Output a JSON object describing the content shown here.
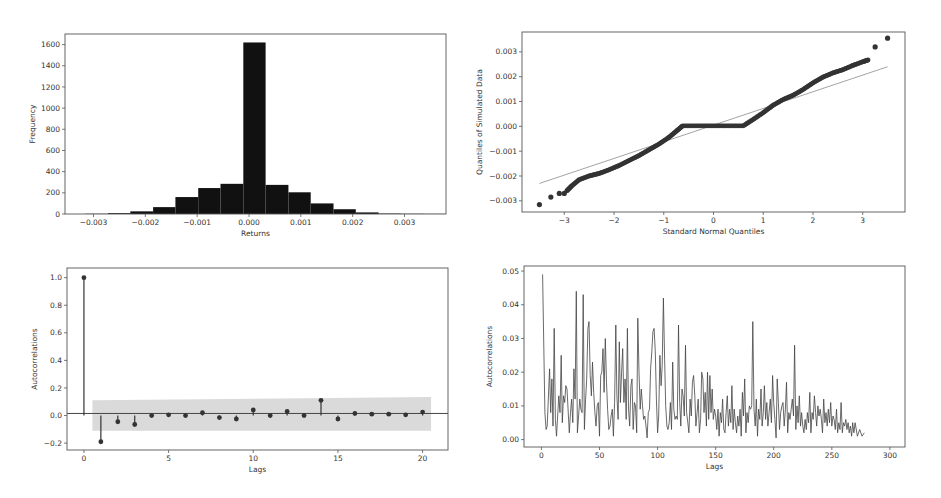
{
  "chart_data": [
    {
      "id": "histogram",
      "type": "bar",
      "title": "",
      "xlabel": "Returns",
      "ylabel": "Frequency",
      "xlim": [
        -0.00355,
        0.0038
      ],
      "ylim": [
        0,
        1700
      ],
      "xticks": [
        -0.003,
        -0.002,
        -0.001,
        0.0,
        0.001,
        0.002,
        0.003
      ],
      "xtick_labels": [
        "−0.003",
        "−0.002",
        "−0.001",
        "0.000",
        "0.001",
        "0.002",
        "0.003"
      ],
      "yticks": [
        0,
        200,
        400,
        600,
        800,
        1000,
        1200,
        1400,
        1600
      ],
      "bin_edges": [
        -0.00316,
        -0.00272,
        -0.00229,
        -0.00185,
        -0.00142,
        -0.00098,
        -0.00055,
        -0.00011,
        0.00032,
        0.00076,
        0.00119,
        0.00163,
        0.00206,
        0.0025,
        0.00293,
        0.00337,
        0.0038
      ],
      "values": [
        2,
        8,
        25,
        65,
        160,
        245,
        285,
        1620,
        275,
        205,
        100,
        45,
        15,
        4,
        2,
        1
      ],
      "color": "#111111",
      "grid": false
    },
    {
      "id": "qq-plot",
      "type": "scatter",
      "title": "",
      "xlabel": "Standard Normal Quantiles",
      "ylabel": "Quantiles of Simulated Data",
      "xlim": [
        -3.85,
        3.85
      ],
      "ylim": [
        -0.00345,
        0.0038
      ],
      "xticks": [
        -3,
        -2,
        -1,
        0,
        1,
        2,
        3
      ],
      "xtick_labels": [
        "−3",
        "−2",
        "−1",
        "0",
        "1",
        "2",
        "3"
      ],
      "yticks": [
        -0.003,
        -0.002,
        -0.001,
        0.0,
        0.001,
        0.002,
        0.003
      ],
      "ytick_labels": [
        "−0.003",
        "−0.002",
        "−0.001",
        "0.000",
        "0.001",
        "0.002",
        "0.003"
      ],
      "series": [
        {
          "name": "sample quantiles",
          "points": [
            [
              -3.5,
              -0.00315
            ],
            [
              -3.27,
              -0.00285
            ],
            [
              -3.1,
              -0.0027
            ],
            [
              -3.0,
              -0.0027
            ],
            [
              -2.95,
              -0.0026
            ],
            [
              -2.85,
              -0.0024
            ],
            [
              -2.7,
              -0.00215
            ],
            [
              -2.5,
              -0.002
            ],
            [
              -2.3,
              -0.0019
            ],
            [
              -2.1,
              -0.00175
            ],
            [
              -1.9,
              -0.00158
            ],
            [
              -1.7,
              -0.00138
            ],
            [
              -1.5,
              -0.00118
            ],
            [
              -1.3,
              -0.00095
            ],
            [
              -1.1,
              -0.00072
            ],
            [
              -0.9,
              -0.00045
            ],
            [
              -0.75,
              -0.0002
            ],
            [
              -0.62,
              2e-05
            ],
            [
              -0.3,
              2e-05
            ],
            [
              0.0,
              2e-05
            ],
            [
              0.3,
              2e-05
            ],
            [
              0.6,
              2e-05
            ],
            [
              0.8,
              0.00028
            ],
            [
              1.0,
              0.00055
            ],
            [
              1.2,
              0.00085
            ],
            [
              1.4,
              0.00108
            ],
            [
              1.6,
              0.00125
            ],
            [
              1.8,
              0.00148
            ],
            [
              2.0,
              0.00175
            ],
            [
              2.2,
              0.00198
            ],
            [
              2.4,
              0.00215
            ],
            [
              2.6,
              0.00228
            ],
            [
              2.8,
              0.00245
            ],
            [
              3.0,
              0.0026
            ],
            [
              3.12,
              0.00268
            ],
            [
              3.25,
              0.0032
            ],
            [
              3.5,
              0.00355
            ]
          ],
          "color": "#333333"
        },
        {
          "name": "reference line",
          "points": [
            [
              -3.5,
              -0.0023
            ],
            [
              3.5,
              0.0024
            ]
          ],
          "color": "#999999"
        }
      ],
      "grid": false
    },
    {
      "id": "acf-stem",
      "type": "bar",
      "subtype": "stem",
      "title": "",
      "xlabel": "Lags",
      "ylabel": "Autocorrelations",
      "xlim": [
        -1,
        21.5
      ],
      "ylim": [
        -0.25,
        1.07
      ],
      "xticks": [
        0,
        5,
        10,
        15,
        20
      ],
      "yticks": [
        -0.2,
        0.0,
        0.2,
        0.4,
        0.6,
        0.8,
        1.0
      ],
      "ytick_labels": [
        "−0.2",
        "0.0",
        "0.2",
        "0.4",
        "0.6",
        "0.8",
        "1.0"
      ],
      "categories": [
        0,
        1,
        2,
        3,
        4,
        5,
        6,
        7,
        8,
        9,
        10,
        11,
        12,
        13,
        14,
        15,
        16,
        17,
        18,
        19,
        20
      ],
      "values": [
        1.0,
        -0.19,
        -0.045,
        -0.065,
        0.0,
        0.005,
        0.0,
        0.02,
        -0.015,
        -0.025,
        0.04,
        0.0,
        0.03,
        0.0,
        0.11,
        -0.025,
        0.015,
        0.01,
        0.01,
        0.005,
        0.025
      ],
      "confidence_band": {
        "x_start": 0.5,
        "x_end": 20.5,
        "upper_start": 0.11,
        "upper_end": 0.135,
        "lower_start": -0.11,
        "lower_end": -0.11,
        "color": "#d6d6d6"
      },
      "color": "#333333",
      "grid": false
    },
    {
      "id": "acf-line",
      "type": "line",
      "title": "",
      "xlabel": "Lags",
      "ylabel": "Autocorrelations",
      "xlim": [
        -15,
        313
      ],
      "ylim": [
        -0.0022,
        0.0515
      ],
      "xticks": [
        0,
        50,
        100,
        150,
        200,
        250,
        300
      ],
      "yticks": [
        0.0,
        0.01,
        0.02,
        0.03,
        0.04,
        0.05
      ],
      "ytick_labels": [
        "0.00",
        "0.01",
        "0.02",
        "0.03",
        "0.04",
        "0.05"
      ],
      "x": [
        1,
        3,
        4,
        5,
        7,
        8,
        9,
        10,
        11,
        12,
        13,
        15,
        16,
        17,
        18,
        19,
        20,
        21,
        22,
        24,
        25,
        26,
        27,
        28,
        29,
        30,
        31,
        33,
        34,
        35,
        36,
        37,
        38,
        39,
        40,
        41,
        42,
        43,
        44,
        45,
        46,
        47,
        48,
        49,
        50,
        51,
        52,
        53,
        54,
        55,
        56,
        57,
        58,
        59,
        60,
        61,
        62,
        63,
        64,
        65,
        66,
        67,
        68,
        69,
        70,
        71,
        72,
        73,
        74,
        75,
        76,
        77,
        78,
        79,
        80,
        81,
        82,
        83,
        84,
        85,
        86,
        87,
        88,
        89,
        90,
        91,
        92,
        93,
        94,
        95,
        96,
        97,
        98,
        99,
        100,
        101,
        102,
        103,
        104,
        105,
        106,
        107,
        108,
        109,
        110,
        111,
        112,
        113,
        114,
        115,
        116,
        117,
        118,
        119,
        120,
        121,
        122,
        123,
        124,
        125,
        126,
        127,
        128,
        129,
        130,
        131,
        132,
        133,
        134,
        135,
        136,
        137,
        138,
        139,
        140,
        141,
        142,
        143,
        144,
        145,
        146,
        147,
        148,
        149,
        150,
        151,
        152,
        153,
        154,
        155,
        156,
        157,
        158,
        159,
        160,
        161,
        162,
        163,
        164,
        165,
        166,
        167,
        168,
        169,
        170,
        171,
        172,
        173,
        174,
        175,
        176,
        177,
        178,
        179,
        180,
        181,
        182,
        183,
        184,
        185,
        186,
        187,
        188,
        189,
        190,
        191,
        192,
        193,
        194,
        195,
        196,
        197,
        198,
        199,
        200,
        201,
        202,
        203,
        204,
        205,
        206,
        207,
        208,
        209,
        210,
        211,
        212,
        213,
        214,
        215,
        216,
        217,
        218,
        219,
        220,
        221,
        222,
        223,
        224,
        225,
        226,
        227,
        228,
        229,
        230,
        231,
        232,
        233,
        234,
        235,
        236,
        237,
        238,
        239,
        240,
        241,
        242,
        243,
        244,
        245,
        246,
        247,
        248,
        249,
        250,
        251,
        252,
        253,
        254,
        255,
        256,
        257,
        258,
        259,
        260,
        261,
        262,
        263,
        264,
        265,
        266,
        267,
        268,
        269,
        270,
        272,
        274,
        276,
        278,
        280,
        282,
        284,
        286,
        288,
        290,
        292,
        294,
        296,
        297
      ],
      "values": [
        0.049,
        0.008,
        0.003,
        0.004,
        0.021,
        0.008,
        0.018,
        0.004,
        0.033,
        0.006,
        0.001,
        0.013,
        0.008,
        0.025,
        0.005,
        0.013,
        0.011,
        0.016,
        0.015,
        0.002,
        0.008,
        0.012,
        0.005,
        0.021,
        0.012,
        0.044,
        0.002,
        0.012,
        0.009,
        0.008,
        0.043,
        0.003,
        0.012,
        0.018,
        0.033,
        0.035,
        0.019,
        0.013,
        0.023,
        0.014,
        0.008,
        0.004,
        0.01,
        0.011,
        0.001,
        0.019,
        0.02,
        0.027,
        0.014,
        0.03,
        0.017,
        0.009,
        0.003,
        0.004,
        0.007,
        0.009,
        0.001,
        0.011,
        0.034,
        0.013,
        0.006,
        0.029,
        0.011,
        0.02,
        0.027,
        0.011,
        0.018,
        0.006,
        0.033,
        0.009,
        0.004,
        0.016,
        0.018,
        0.003,
        0.011,
        0.01,
        0.002,
        0.036,
        0.02,
        0.009,
        0.015,
        0.01,
        0.006,
        0.007,
        0.004,
        0.0005,
        0.008,
        0.009,
        0.021,
        0.026,
        0.032,
        0.033,
        0.026,
        0.012,
        0.002,
        0.007,
        0.025,
        0.016,
        0.022,
        0.042,
        0.024,
        0.01,
        0.004,
        0.003,
        0.005,
        0.011,
        0.003,
        0.023,
        0.009,
        0.006,
        0.007,
        0.006,
        0.034,
        0.011,
        0.004,
        0.015,
        0.013,
        0.007,
        0.028,
        0.008,
        0.005,
        0.002,
        0.012,
        0.007,
        0.017,
        0.019,
        0.013,
        0.004,
        0.008,
        0.012,
        0.002,
        0.006,
        0.02,
        0.018,
        0.008,
        0.014,
        0.004,
        0.02,
        0.006,
        0.019,
        0.008,
        0.015,
        0.006,
        0.009,
        0.007,
        0.003,
        0.009,
        0.001,
        0.008,
        0.005,
        0.012,
        0.003,
        0.002,
        0.008,
        0.013,
        0.004,
        0.009,
        0.005,
        0.016,
        0.003,
        0.009,
        0.005,
        0.002,
        0.007,
        0.004,
        0.009,
        0.001,
        0.014,
        0.007,
        0.018,
        0.002,
        0.008,
        0.005,
        0.01,
        0.009,
        0.01,
        0.035,
        0.009,
        0.004,
        0.012,
        0.001,
        0.009,
        0.006,
        0.015,
        0.004,
        0.008,
        0.016,
        0.006,
        0.011,
        0.004,
        0.008,
        0.012,
        0.005,
        0.019,
        0.011,
        0.006,
        0.0005,
        0.018,
        0.011,
        0.003,
        0.008,
        0.01,
        0.011,
        0.004,
        0.009,
        0.017,
        0.002,
        0.008,
        0.006,
        0.009,
        0.012,
        0.007,
        0.028,
        0.003,
        0.01,
        0.005,
        0.013,
        0.004,
        0.008,
        0.004,
        0.002,
        0.006,
        0.003,
        0.008,
        0.005,
        0.014,
        0.002,
        0.008,
        0.006,
        0.013,
        0.008,
        0.004,
        0.01,
        0.007,
        0.009,
        0.006,
        0.002,
        0.012,
        0.005,
        0.008,
        0.004,
        0.009,
        0.005,
        0.011,
        0.004,
        0.007,
        0.006,
        0.003,
        0.009,
        0.002,
        0.005,
        0.003,
        0.011,
        0.002,
        0.005,
        0.004,
        0.006,
        0.003,
        0.005,
        0.002,
        0.004,
        0.001,
        0.005,
        0.002,
        0.005,
        0.001,
        0.003,
        0.001,
        0.002
      ],
      "color": "#444444",
      "grid": false
    }
  ],
  "layout": {
    "panels": [
      {
        "frame": [
          65,
          34,
          446,
          214
        ]
      },
      {
        "frame": [
          522,
          32,
          905,
          212
        ]
      },
      {
        "frame": [
          67,
          268,
          448,
          450
        ]
      },
      {
        "frame": [
          524,
          266,
          905,
          447
        ]
      }
    ]
  }
}
